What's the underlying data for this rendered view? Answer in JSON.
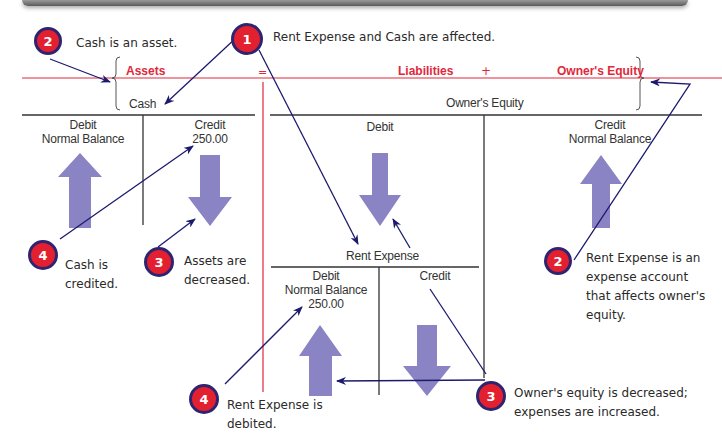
{
  "equation": {
    "assets": "Assets",
    "equals": "=",
    "liabilities": "Liabilities",
    "plus": "+",
    "owners_equity": "Owner's Equity"
  },
  "accounts": {
    "cash": {
      "title": "Cash",
      "debit_label": "Debit",
      "debit_sub": "Normal Balance",
      "credit_label": "Credit",
      "credit_amount": "250.00"
    },
    "owners_equity": {
      "title": "Owner's Equity",
      "debit_label": "Debit",
      "credit_label": "Credit",
      "credit_sub": "Normal Balance"
    },
    "rent_expense": {
      "title": "Rent Expense",
      "debit_label": "Debit",
      "debit_sub": "Normal Balance",
      "debit_amount": "250.00",
      "credit_label": "Credit"
    }
  },
  "callouts": [
    {
      "number": "1",
      "text": "Rent Expense and Cash are affected."
    },
    {
      "number": "2",
      "text": "Cash is an asset."
    },
    {
      "number": "2",
      "text": "Rent Expense is an expense account that affects owner's equity."
    },
    {
      "number": "3",
      "text": "Assets are decreased."
    },
    {
      "number": "3",
      "text": "Owner's equity is decreased; expenses are increased."
    },
    {
      "number": "4",
      "text": "Cash is credited."
    },
    {
      "number": "4",
      "text": "Rent Expense is debited."
    }
  ],
  "colors": {
    "equation_red": "#e0283a",
    "arrow_lavender": "#8a84c4",
    "pointer_navy": "#1c1a6e",
    "badge_red": "#e32030"
  }
}
